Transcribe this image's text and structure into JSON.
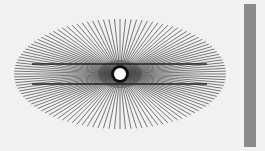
{
  "figure": {
    "name": "hering-illusion",
    "background": "#f1f1f1",
    "rays": {
      "count": 120,
      "color": "#555555",
      "center": [
        120,
        74
      ],
      "rx": 106,
      "ry": 55
    },
    "parallel_lines": {
      "color": "#222222",
      "y": [
        64,
        84
      ],
      "x_start": 32,
      "x_end": 207
    },
    "center_dot": {
      "fill": "#ffffff",
      "ring": "#111111",
      "radius": 6,
      "ring_radius": 9
    },
    "side_bar": {
      "color": "#8a8a8a"
    }
  }
}
